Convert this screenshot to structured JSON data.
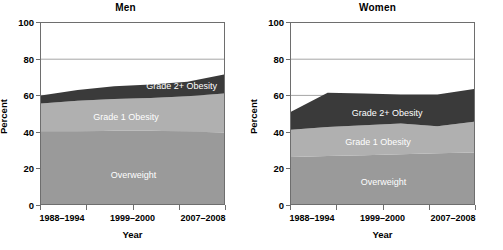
{
  "figure": {
    "xlabel": "Year",
    "ylabel": "Percent"
  },
  "colors": {
    "overweight": "#9a9a9a",
    "grade1": "#b0b0b0",
    "grade2": "#3a3a3a",
    "axis": "#6e6e6e",
    "gridline": "#8c8c8c",
    "label_text": "#ffffff",
    "background": "#ffffff"
  },
  "panels": [
    {
      "id": "men",
      "title": "Men"
    },
    {
      "id": "women",
      "title": "Women"
    }
  ],
  "axis": {
    "y_ticks": [
      "100",
      "80",
      "60",
      "40",
      "20",
      "0"
    ],
    "x_tick_labels": [
      "1988–1994",
      "1999–2000",
      "2007–2008"
    ]
  },
  "legend_labels": {
    "overweight": "Overweight",
    "grade1": "Grade 1 Obesity",
    "grade2": "Grade 2+ Obesity"
  },
  "chart_data": [
    {
      "type": "area",
      "title": "Men",
      "xlabel": "Year",
      "ylabel": "Percent",
      "ylim": [
        0,
        100
      ],
      "grid": true,
      "stacked": true,
      "legend_position": "inline-on-bands",
      "x": [
        "1988–1994",
        "1999–2000",
        "2001–2002",
        "2003–2004",
        "2005–2006",
        "2007–2008"
      ],
      "xtick_labels": [
        "1988–1994",
        "1999–2000",
        "2007–2008"
      ],
      "series": [
        {
          "name": "Overweight",
          "values": [
            40,
            40,
            40.5,
            40.5,
            40,
            39.5
          ]
        },
        {
          "name": "Grade 1 Obesity",
          "values": [
            15.5,
            17,
            17.5,
            18,
            19.5,
            21.5
          ]
        },
        {
          "name": "Grade 2+ Obesity",
          "values": [
            4.5,
            6,
            7,
            7.5,
            8,
            10.5
          ]
        }
      ],
      "cumulative_top": [
        60,
        63,
        65,
        66,
        67.5,
        71.5
      ]
    },
    {
      "type": "area",
      "title": "Women",
      "xlabel": "Year",
      "ylabel": "Percent",
      "ylim": [
        0,
        100
      ],
      "grid": true,
      "stacked": true,
      "legend_position": "inline-on-bands",
      "x": [
        "1988–1994",
        "1999–2000",
        "2001–2002",
        "2003–2004",
        "2005–2006",
        "2007–2008"
      ],
      "xtick_labels": [
        "1988–1994",
        "1999–2000",
        "2007–2008"
      ],
      "series": [
        {
          "name": "Overweight",
          "values": [
            26,
            26.5,
            27,
            27.5,
            28,
            28.5
          ]
        },
        {
          "name": "Grade 1 Obesity",
          "values": [
            15,
            16,
            16.5,
            17,
            15,
            17
          ]
        },
        {
          "name": "Grade 2+ Obesity",
          "values": [
            10,
            19,
            17.5,
            16,
            17.5,
            18
          ]
        }
      ],
      "cumulative_top": [
        51,
        61.5,
        61,
        60.5,
        60.5,
        63.5
      ]
    }
  ]
}
